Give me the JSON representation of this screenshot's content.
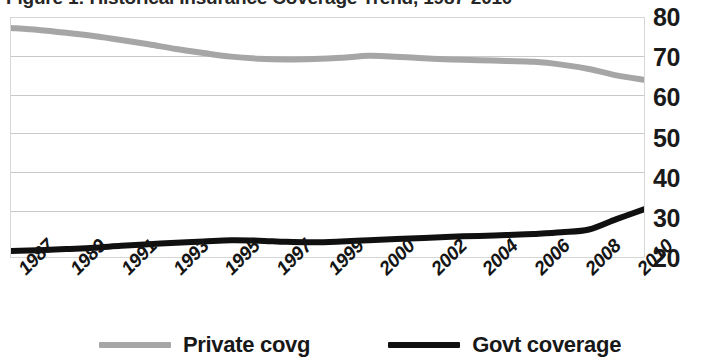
{
  "chart_data": {
    "type": "line",
    "title": "Figure 1: Historical Insurance Coverage Trend, 1987-2010",
    "xlabel": "",
    "ylabel": "",
    "ylim": [
      20,
      80
    ],
    "yticks": [
      80,
      70,
      60,
      50,
      40,
      30,
      20
    ],
    "grid": true,
    "legend_position": "bottom",
    "x": [
      1987,
      1988,
      1989,
      1990,
      1991,
      1992,
      1993,
      1994,
      1995,
      1996,
      1997,
      1998,
      1999,
      2000,
      2001,
      2002,
      2003,
      2004,
      2005,
      2006,
      2007,
      2008,
      2009,
      2010
    ],
    "xtick_labels": [
      "1987",
      "1989",
      "1991",
      "1993",
      "1995",
      "1997",
      "1999",
      "2000",
      "2002",
      "2004",
      "2006",
      "2008",
      "2010"
    ],
    "series": [
      {
        "name": "Private covg",
        "color": "#a6a6a6",
        "values": [
          77.5,
          77.0,
          76.3,
          75.5,
          74.5,
          73.4,
          72.2,
          71.2,
          70.3,
          69.8,
          69.6,
          69.7,
          70.0,
          70.5,
          70.3,
          69.9,
          69.6,
          69.4,
          69.2,
          69.0,
          68.3,
          67.2,
          65.6,
          64.5
        ]
      },
      {
        "name": "Govt coverage",
        "color": "#101010",
        "values": [
          21.5,
          21.7,
          22.0,
          22.3,
          22.8,
          23.2,
          23.6,
          23.9,
          24.2,
          24.1,
          23.8,
          23.7,
          23.9,
          24.2,
          24.5,
          24.8,
          25.1,
          25.3,
          25.5,
          25.8,
          26.2,
          26.9,
          29.5,
          32.0
        ]
      }
    ]
  },
  "title": {
    "text": "Figure 1: Historical Insurance Coverage Trend, 1987-2010"
  },
  "axes": {
    "y_ticks": [
      "80",
      "70",
      "60",
      "50",
      "40",
      "30",
      "20"
    ],
    "x_ticks": [
      "1987",
      "1989",
      "1991",
      "1993",
      "1995",
      "1997",
      "1999",
      "2000",
      "2002",
      "2004",
      "2006",
      "2008",
      "2010"
    ]
  },
  "legend": {
    "items": [
      {
        "label": "Private covg",
        "color": "#a6a6a6"
      },
      {
        "label": "Govt coverage",
        "color": "#101010"
      }
    ]
  }
}
